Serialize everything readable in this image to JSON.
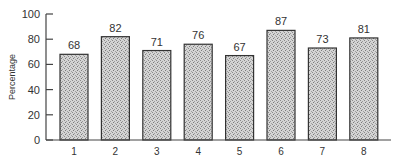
{
  "chart_data": {
    "type": "bar",
    "title": "",
    "xlabel": "",
    "ylabel": "Percentage",
    "ylim": [
      0,
      100
    ],
    "yticks": [
      0,
      20,
      40,
      60,
      80,
      100
    ],
    "ytick_labels": [
      "0",
      "20",
      "40",
      "60",
      "80",
      "100"
    ],
    "categories": [
      "1",
      "2",
      "3",
      "4",
      "5",
      "6",
      "7",
      "8"
    ],
    "values": [
      68,
      82,
      71,
      76,
      67,
      87,
      73,
      81
    ],
    "data_labels": [
      "68",
      "82",
      "71",
      "76",
      "67",
      "87",
      "73",
      "81"
    ],
    "grid": false,
    "legend": "none",
    "bar_fill": "#c8c8c8",
    "bar_edge": "#333333"
  }
}
